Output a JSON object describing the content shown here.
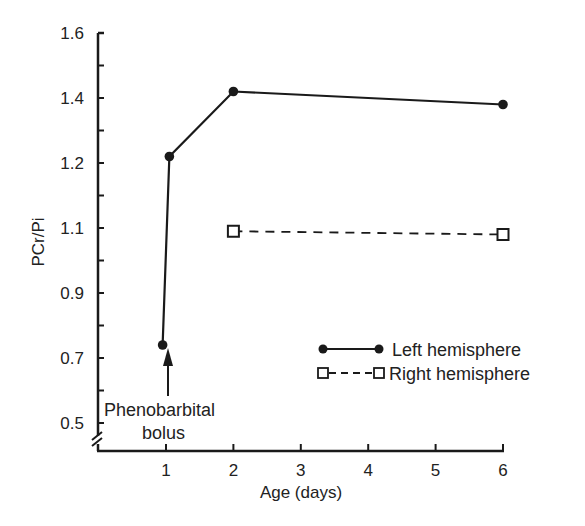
{
  "chart_data": {
    "type": "line",
    "title": "",
    "xlabel": "Age (days)",
    "ylabel": "PCr/Pi",
    "x_ticks": [
      "1",
      "2",
      "3",
      "4",
      "5",
      "6"
    ],
    "y_ticks": [
      "1.6",
      "1.4",
      "1.2",
      "1.1",
      "0.9",
      "0.7",
      "0.5"
    ],
    "xlim": [
      0,
      6
    ],
    "ylim": [
      0.45,
      1.6
    ],
    "grid": false,
    "legend_position": "lower right",
    "axis_break": "y-axis, below 0.5",
    "series": [
      {
        "name": "Left hemisphere",
        "style": "solid line, filled circle markers",
        "points": [
          {
            "x": 0.95,
            "y": 0.74
          },
          {
            "x": 1.05,
            "y": 1.22
          },
          {
            "x": 2,
            "y": 1.42
          },
          {
            "x": 6,
            "y": 1.38
          }
        ]
      },
      {
        "name": "Right hemisphere",
        "style": "dashed line, open square markers",
        "points": [
          {
            "x": 2,
            "y": 1.09
          },
          {
            "x": 6,
            "y": 1.08
          }
        ]
      }
    ],
    "annotations": [
      {
        "text": "Phenobarbital bolus",
        "lines": [
          "Phenobarbital",
          "bolus"
        ],
        "arrow_to": {
          "x": 1.05,
          "y": 0.74
        }
      }
    ]
  },
  "colors": {
    "ink": "#1a1a1a",
    "background": "#ffffff"
  }
}
